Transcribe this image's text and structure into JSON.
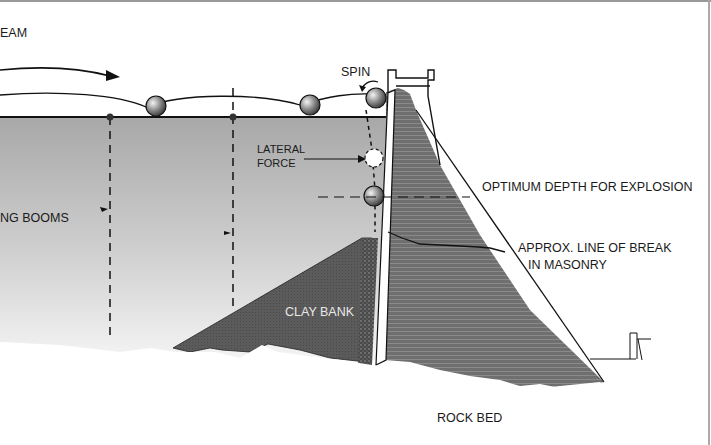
{
  "diagram": {
    "labels": {
      "stream": "EAM",
      "booms": "NG BOOMS",
      "spin": "SPIN",
      "lateral_force_1": "LATERAL",
      "lateral_force_2": "FORCE",
      "optimum_depth": "OPTIMUM DEPTH FOR EXPLOSION",
      "line_of_break_1": "APPROX. LINE OF BREAK",
      "line_of_break_2": "IN MASONRY",
      "clay_bank": "CLAY BANK",
      "rock_bed": "ROCK BED"
    },
    "colors": {
      "water_top": "#a9a9a9",
      "water_bottom": "#f2f2f2",
      "dam_masonry": "#6e6e6e",
      "clay_bank": "#5a5a5a",
      "line": "#111111"
    }
  }
}
